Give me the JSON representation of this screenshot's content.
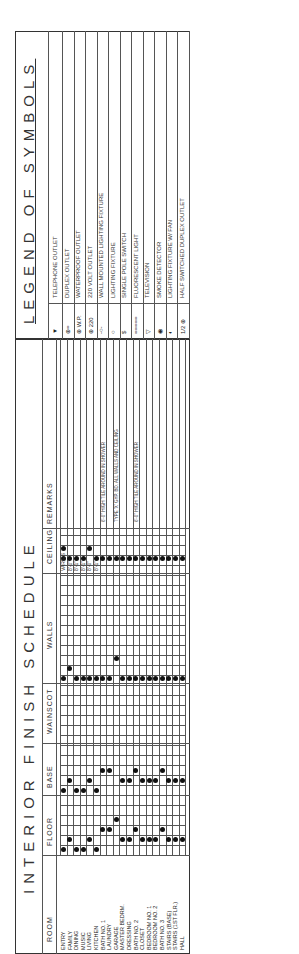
{
  "schedule": {
    "title": "INTERIOR FINISH SCHEDULE",
    "headers": {
      "room": "ROOM",
      "floor": "FLOOR",
      "base": "BASE",
      "wainscot": "WAINSCOT",
      "walls": "WALLS",
      "ceiling": "CEILING",
      "remarks": "REMARKS"
    },
    "sub_columns": {
      "floor": [
        "QUARRY TILE",
        "CARPET",
        "LINOLEUM",
        "CONCRETE"
      ],
      "base": [
        "QUARRY TILE",
        "WOOD",
        "COVED LINO."
      ],
      "walls": [
        "GYP. BD. 1/2\"",
        "CEDAR SIDING",
        "GYP. BD. 5/8\""
      ],
      "ceiling": [
        "CEILING HEIGHT",
        "GYP. BD.",
        "WOOD"
      ]
    },
    "rooms": [
      "ENTRY",
      "FAMILY",
      "DINING",
      "MUSIC",
      "LIVING",
      "KITCHEN",
      "BATH NO. 1",
      "LAUNDRY",
      "GARAGE",
      "MASTER BEDRM.",
      "DRESSING",
      "BATH NO. 2",
      "CLOSET",
      "BEDROOM NO. 1",
      "BEDROOM NO. 2",
      "BATH NO. 3",
      "STAIRS (BASE)",
      "STAIRS (1ST FLR.)",
      "HALL"
    ],
    "ceiling_heights": [
      "VARIES",
      "8'-0\"",
      "8'-1\"",
      "8'-1\"",
      "8'-0\"",
      "8'-1\""
    ],
    "remarks": [
      {
        "row": 6,
        "text": "6'-0\" HIGH TILE AROUND IN SHOWER"
      },
      {
        "row": 8,
        "text": "TYPE 'X' GYP. BD. ALL WALLS AND CEILING"
      },
      {
        "row": 11,
        "text": "6'-0\" HIGH TILE AROUND IN SHOWER"
      }
    ],
    "marks": {
      "floor_quarry_tile": [
        0,
        2,
        3,
        5
      ],
      "floor_carpet": [
        1,
        4,
        9,
        10,
        12,
        13,
        14,
        16,
        17,
        18
      ],
      "floor_linoleum": [
        6,
        7,
        11,
        15
      ],
      "floor_concrete": [
        8
      ],
      "base_quarry_tile": [
        0,
        2,
        3,
        5
      ],
      "base_wood": [
        1,
        4,
        9,
        10,
        12,
        13,
        14,
        16,
        17,
        18
      ],
      "base_coved_lino": [
        6,
        7,
        11,
        15
      ],
      "walls_gyp_half": [
        0,
        2,
        3,
        4,
        5,
        6,
        7,
        9,
        10,
        11,
        12,
        13,
        14,
        15,
        16,
        17,
        18
      ],
      "walls_cedar": [
        1
      ],
      "walls_gyp_5_8": [
        8
      ],
      "ceiling_gyp": [
        0,
        1,
        2,
        3,
        5,
        6,
        7,
        8,
        9,
        10,
        11,
        12,
        13,
        14,
        15,
        16,
        17,
        18
      ],
      "ceiling_wood": [
        0,
        4
      ]
    }
  },
  "legend": {
    "title": "LEGEND OF SYMBOLS",
    "items": [
      {
        "symbol": "▼",
        "label": "TELEPHONE OUTLET"
      },
      {
        "symbol": "⊕=",
        "label": "DUPLEX OUTLET"
      },
      {
        "symbol": "⊕ W.P.",
        "label": "WATERPROOF OUTLET"
      },
      {
        "symbol": "⊕ 220",
        "label": "220 VOLT OUTLET"
      },
      {
        "symbol": "-○-",
        "label": "WALL MOUNTED LIGHTING FIXTURE"
      },
      {
        "symbol": "○",
        "label": "LIGHTING FIXTURE"
      },
      {
        "symbol": "$",
        "label": "SINGLE POLE SWITCH"
      },
      {
        "symbol": "=====",
        "label": "FLUORESCENT LIGHT"
      },
      {
        "symbol": "▽",
        "label": "TELEVISION"
      },
      {
        "symbol": "◉",
        "label": "SMOKE DETECTOR"
      },
      {
        "symbol": "◐",
        "label": "LIGHTING FIXTURE W/ FAN"
      },
      {
        "symbol": "1/2 ⊕",
        "label": "HALF SWITCHED DUPLEX OUTLET"
      }
    ]
  }
}
